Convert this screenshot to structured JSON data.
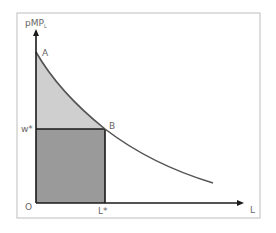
{
  "diagram": {
    "y_axis_label": "pMP",
    "y_axis_subscript": "L",
    "x_axis_label": "L",
    "origin_label": "O",
    "point_a_label": "A",
    "point_b_label": "B",
    "wage_label": "w*",
    "labor_label": "L*",
    "colors": {
      "frame": "#c8c8c8",
      "axes": "#1a1a1a",
      "curve": "#555555",
      "upper_region": "#cfcfcf",
      "lower_region": "#9a9a9a",
      "labels": "#666666"
    }
  }
}
